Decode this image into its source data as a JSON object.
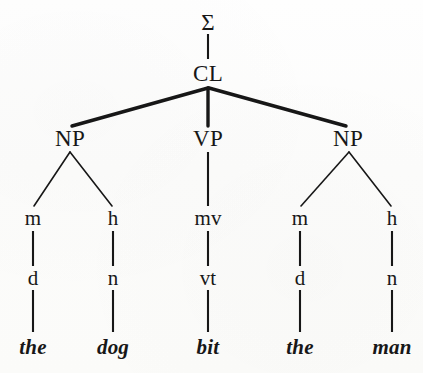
{
  "figure": {
    "name": "constituent-syntax-tree",
    "sentence": "the dog bit the man",
    "ink_color": "#171717",
    "background_color": "#fdfdfc"
  },
  "nodes": {
    "root": {
      "label": "Σ",
      "x": 208,
      "y": 22
    },
    "clause": {
      "label": "CL",
      "x": 208,
      "y": 73
    },
    "phrases": [
      {
        "label": "NP",
        "x": 70,
        "y": 138
      },
      {
        "label": "VP",
        "x": 208,
        "y": 138
      },
      {
        "label": "NP",
        "x": 348,
        "y": 138
      }
    ],
    "functions": [
      {
        "label": "m",
        "x": 33,
        "y": 218
      },
      {
        "label": "h",
        "x": 113,
        "y": 218
      },
      {
        "label": "mv",
        "x": 208,
        "y": 218
      },
      {
        "label": "m",
        "x": 300,
        "y": 218
      },
      {
        "label": "h",
        "x": 392,
        "y": 218
      }
    ],
    "categories": [
      {
        "label": "d",
        "x": 33,
        "y": 278
      },
      {
        "label": "n",
        "x": 113,
        "y": 278
      },
      {
        "label": "vt",
        "x": 208,
        "y": 278
      },
      {
        "label": "d",
        "x": 300,
        "y": 278
      },
      {
        "label": "n",
        "x": 392,
        "y": 278
      }
    ],
    "words": [
      {
        "label": "the",
        "x": 33,
        "y": 347
      },
      {
        "label": "dog",
        "x": 113,
        "y": 347
      },
      {
        "label": "bit",
        "x": 208,
        "y": 347
      },
      {
        "label": "the",
        "x": 300,
        "y": 347
      },
      {
        "label": "man",
        "x": 392,
        "y": 347
      }
    ]
  },
  "edges": {
    "thick_width": 3.4,
    "thin_width": 1.5,
    "stub_width": 2.1
  }
}
